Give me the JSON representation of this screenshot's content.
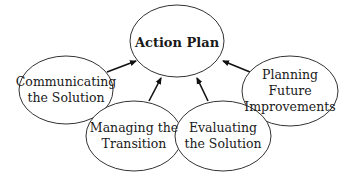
{
  "diagram": {
    "title": "Action Plan",
    "central_node": {
      "label": "Action Plan",
      "cx": 177,
      "cy": 42,
      "rx": 47,
      "ry": 36
    },
    "nodes": [
      {
        "id": "communicating",
        "line1": "Communicating",
        "line2": "the Solution",
        "line3": "",
        "cx": 66,
        "cy": 90,
        "rx": 47,
        "ry": 34
      },
      {
        "id": "managing",
        "line1": "Managing the",
        "line2": "Transition",
        "line3": "",
        "cx": 141,
        "cy": 136,
        "rx": 48,
        "ry": 36
      },
      {
        "id": "evaluating",
        "line1": "Evaluating",
        "line2": "the Solution",
        "line3": "",
        "cx": 224,
        "cy": 136,
        "rx": 47,
        "ry": 36
      },
      {
        "id": "planning",
        "line1": "Planning",
        "line2": "Future",
        "line3": "Improvements",
        "cx": 290,
        "cy": 91,
        "rx": 48,
        "ry": 35
      }
    ],
    "edges": [
      {
        "from": "communicating",
        "to": "Action Plan"
      },
      {
        "from": "managing",
        "to": "Action Plan"
      },
      {
        "from": "evaluating",
        "to": "Action Plan"
      },
      {
        "from": "planning",
        "to": "Action Plan"
      }
    ],
    "colors": {
      "stroke": "#333333",
      "fill": "#ffffff",
      "text": "#1a1a1a"
    }
  }
}
